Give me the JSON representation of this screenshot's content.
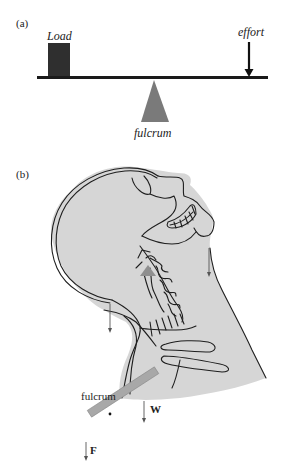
{
  "panel_a": {
    "label": "(a)",
    "load_label": "Load",
    "effort_label": "effort",
    "fulcrum_label": "fulcrum",
    "colors": {
      "load_box": "#2f2f2f",
      "beam": "#1a1a1a",
      "fulcrum": "#7a7a7a",
      "arrow": "#111111"
    }
  },
  "panel_b": {
    "label": "(b)",
    "fulcrum_label": "fulcrum",
    "weight_label": "W",
    "force_label": "F",
    "colors": {
      "tissue": "#d6d6d6",
      "outline": "#1e1e1e",
      "lever_bar": "#a8a8a8",
      "fulcrum_marker": "#8f8f8f",
      "arrows": "#555555"
    }
  }
}
